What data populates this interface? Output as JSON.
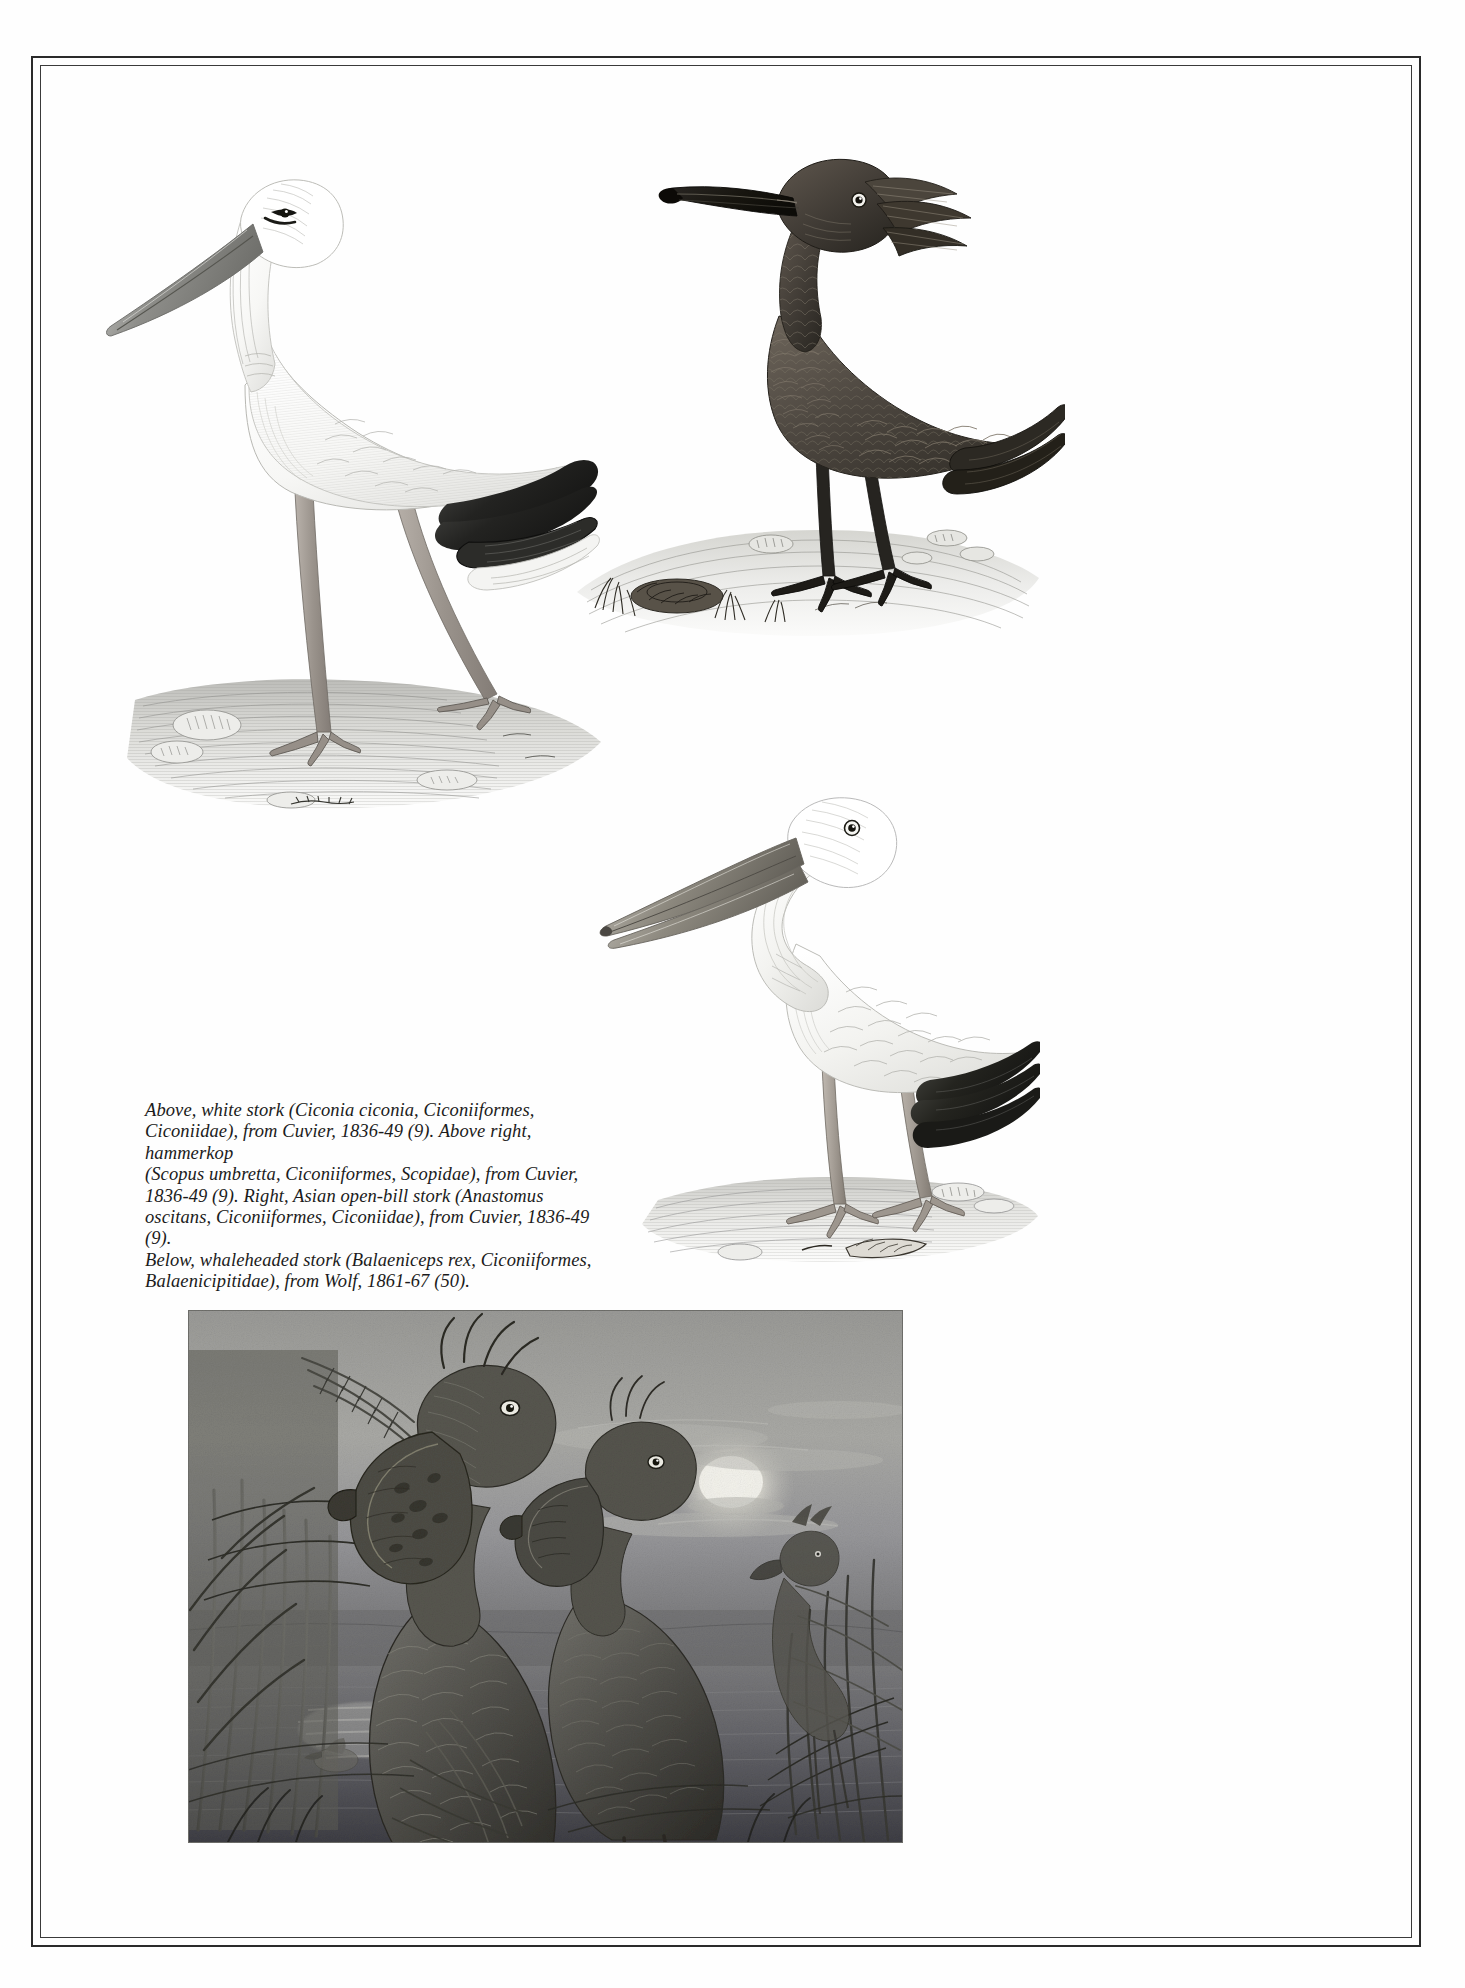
{
  "page": {
    "background_color": "#fefefe",
    "frame_color": "#2a2a2a",
    "ink_color": "#1b1b1b"
  },
  "caption": {
    "lines": [
      "Above, white stork (Ciconia ciconia, Ciconiiformes,",
      "Ciconiidae), from Cuvier, 1836-49 (9). Above right, hammerkop",
      "(Scopus umbretta, Ciconiiformes, Scopidae), from Cuvier,",
      "1836-49 (9). Right, Asian open-bill stork (Anastomus",
      "oscitans, Ciconiiformes, Ciconiidae), from Cuvier, 1836-49 (9).",
      "Below, whaleheaded stork (Balaeniceps rex, Ciconiiformes,",
      "Balaenicipitidae), from Wolf, 1861-67 (50)."
    ],
    "full_text": "Above, white stork (Ciconia ciconia, Ciconiiformes, Ciconiidae), from Cuvier, 1836-49 (9). Above right, hammerkop (Scopus umbretta, Ciconiiformes, Scopidae), from Cuvier, 1836-49 (9). Right, Asian open-bill stork (Anastomus oscitans, Ciconiiformes, Ciconiidae), from Cuvier, 1836-49 (9). Below, whaleheaded stork (Balaeniceps rex, Ciconiiformes, Balaenicipitidae), from Wolf, 1861-67 (50)."
  },
  "figures": [
    {
      "id": "white-stork",
      "common_name": "white stork",
      "scientific_name": "Ciconia ciconia",
      "order": "Ciconiiformes",
      "family": "Ciconiidae",
      "source": "Cuvier, 1836-49 (9)",
      "position": "Above",
      "medium": "engraving"
    },
    {
      "id": "hammerkop",
      "common_name": "hammerkop",
      "scientific_name": "Scopus umbretta",
      "order": "Ciconiiformes",
      "family": "Scopidae",
      "source": "Cuvier, 1836-49 (9)",
      "position": "Above right",
      "medium": "engraving"
    },
    {
      "id": "asian-open-bill-stork",
      "common_name": "Asian open-bill stork",
      "scientific_name": "Anastomus oscitans",
      "order": "Ciconiiformes",
      "family": "Ciconiidae",
      "source": "Cuvier, 1836-49 (9)",
      "position": "Right",
      "medium": "engraving"
    },
    {
      "id": "whaleheaded-stork",
      "common_name": "whaleheaded stork",
      "scientific_name": "Balaeniceps rex",
      "order": "Ciconiiformes",
      "family": "Balaenicipitidae",
      "source": "Wolf, 1861-67 (50)",
      "position": "Below",
      "medium": "halftone plate"
    }
  ]
}
